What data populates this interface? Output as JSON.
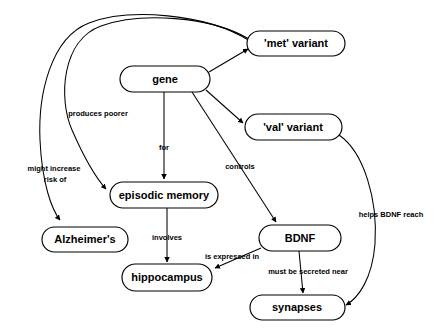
{
  "diagram": {
    "background_color": "#ffffff",
    "line_color": "#000000",
    "node_fill": "#ffffff",
    "nodes": [
      {
        "id": "met",
        "label": "'met' variant",
        "cx": 296,
        "cy": 43.5,
        "w": 98,
        "h": 25
      },
      {
        "id": "gene",
        "label": "gene",
        "cx": 165,
        "cy": 79,
        "w": 90,
        "h": 26
      },
      {
        "id": "val",
        "label": "'val' variant",
        "cx": 293,
        "cy": 127,
        "w": 97,
        "h": 26
      },
      {
        "id": "episodic",
        "label": "episodic memory",
        "cx": 164,
        "cy": 195,
        "w": 108,
        "h": 26
      },
      {
        "id": "alzheimers",
        "label": "Alzheimer's",
        "cx": 85,
        "cy": 239.5,
        "w": 86,
        "h": 25
      },
      {
        "id": "bdnf",
        "label": "BDNF",
        "cx": 300,
        "cy": 238,
        "w": 82,
        "h": 26
      },
      {
        "id": "hippo",
        "label": "hippocampus",
        "cx": 167,
        "cy": 277.5,
        "w": 90,
        "h": 27
      },
      {
        "id": "synapses",
        "label": "synapses",
        "cx": 297,
        "cy": 307.5,
        "w": 95,
        "h": 25
      }
    ],
    "edges": [
      {
        "id": "gene-met",
        "from": "gene",
        "to": "met",
        "label": ""
      },
      {
        "id": "gene-val",
        "from": "gene",
        "to": "val",
        "label": ""
      },
      {
        "id": "gene-episodic",
        "from": "gene",
        "to": "episodic",
        "label": "for"
      },
      {
        "id": "gene-bdnf",
        "from": "gene",
        "to": "bdnf",
        "label": "controls"
      },
      {
        "id": "met-episodic",
        "from": "met",
        "to": "episodic",
        "label": "produces poorer"
      },
      {
        "id": "met-alzheimers",
        "from": "met",
        "to": "alzheimers",
        "label": "might increase risk of"
      },
      {
        "id": "episodic-hippo",
        "from": "episodic",
        "to": "hippo",
        "label": "involves"
      },
      {
        "id": "bdnf-hippo",
        "from": "bdnf",
        "to": "hippo",
        "label": "is expressed in"
      },
      {
        "id": "bdnf-synapses",
        "from": "bdnf",
        "to": "synapses",
        "label": "must be secreted near"
      },
      {
        "id": "val-synapses",
        "from": "val",
        "to": "synapses",
        "label": "helps BDNF reach"
      }
    ],
    "edge_labels": [
      {
        "id": "label-produces-poorer",
        "text": "produces poorer",
        "x": 98,
        "y": 114,
        "lines": [
          "produces poorer"
        ]
      },
      {
        "id": "label-might-increase",
        "text": "might increase risk of",
        "x": 55,
        "y": 175,
        "lines": [
          "might increase",
          "risk of"
        ]
      },
      {
        "id": "label-for",
        "text": "for",
        "x": 164,
        "y": 148,
        "lines": [
          "for"
        ]
      },
      {
        "id": "label-controls",
        "text": "controls",
        "x": 240,
        "y": 167,
        "lines": [
          "controls"
        ]
      },
      {
        "id": "label-involves",
        "text": "involves",
        "x": 167,
        "y": 238,
        "lines": [
          "involves"
        ]
      },
      {
        "id": "label-is-expressed-in",
        "text": "is expressed in",
        "x": 232,
        "y": 257,
        "lines": [
          "is expressed in"
        ]
      },
      {
        "id": "label-must-be-secreted",
        "text": "must be secreted near",
        "x": 308,
        "y": 272,
        "lines": [
          "must be secreted near"
        ]
      },
      {
        "id": "label-helps-bdnf-reach",
        "text": "helps BDNF reach",
        "x": 391,
        "y": 215,
        "lines": [
          "helps BDNF reach"
        ]
      }
    ]
  }
}
